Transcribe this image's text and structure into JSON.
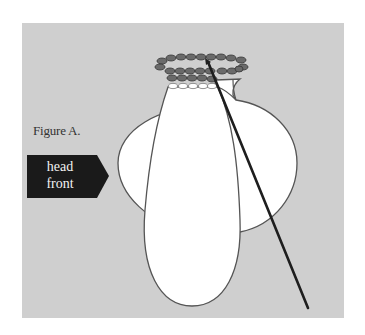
{
  "figure": {
    "label": "Figure A.",
    "tag": {
      "line1": "head",
      "line2": "front"
    }
  },
  "colors": {
    "background": "#cfcfcf",
    "shape_fill": "#ffffff",
    "outline": "#555555",
    "stitch_dark": "#6a6a6a",
    "needle": "#1e1e1e",
    "tag": "#1a1a1a"
  }
}
